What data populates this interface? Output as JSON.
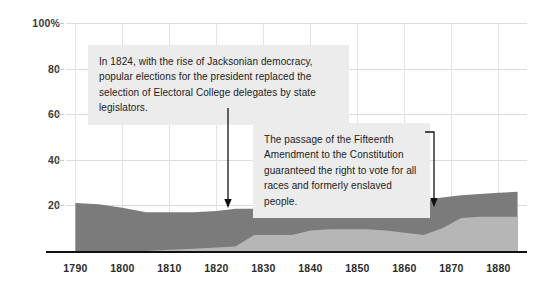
{
  "chart_data": {
    "type": "area",
    "title": "",
    "subtitle": "",
    "xlabel": "",
    "ylabel": "",
    "xlim": [
      1788,
      1886
    ],
    "ylim": [
      0,
      100
    ],
    "grid": true,
    "legend": "none",
    "stacked": true,
    "y_ticks": [
      "100%",
      "80",
      "60",
      "40",
      "20"
    ],
    "y_tick_values": [
      100,
      80,
      60,
      40,
      20
    ],
    "x_ticks": [
      "1790",
      "1800",
      "1810",
      "1820",
      "1830",
      "1840",
      "1850",
      "1860",
      "1870",
      "1880"
    ],
    "x_tick_values": [
      1790,
      1800,
      1810,
      1820,
      1830,
      1840,
      1850,
      1860,
      1870,
      1880
    ],
    "x": [
      1790,
      1795,
      1800,
      1805,
      1810,
      1815,
      1820,
      1824,
      1828,
      1832,
      1836,
      1840,
      1844,
      1848,
      1852,
      1856,
      1860,
      1864,
      1868,
      1872,
      1876,
      1880,
      1884
    ],
    "series": [
      {
        "name": "lower-band",
        "color": "#b6b6b6",
        "values": [
          0,
          0,
          0,
          0,
          0.5,
          1,
          1.5,
          2,
          7,
          7,
          7,
          9,
          9.5,
          9.5,
          9.5,
          9,
          8,
          7,
          10,
          14.5,
          15,
          15,
          15
        ]
      },
      {
        "name": "upper-band",
        "color": "#7b7b7b",
        "values": [
          21,
          20.5,
          19,
          17,
          16.5,
          16,
          16,
          16.5,
          11.5,
          12,
          12.5,
          11.5,
          11.5,
          12,
          12.5,
          14,
          15.5,
          15,
          13.5,
          10,
          10,
          10.5,
          11
        ]
      }
    ],
    "totals": [
      21,
      20.5,
      19,
      17,
      17,
      17,
      17.5,
      18.5,
      18.5,
      19,
      19.5,
      20.5,
      21,
      21.5,
      22,
      23,
      23.5,
      22,
      23.5,
      24.5,
      25,
      25.5,
      26
    ]
  },
  "colors": {
    "area_upper": "#7b7b7b",
    "area_lower": "#b6b6b6",
    "gridline": "#dcdcdc",
    "axis": "#111111",
    "annotation_background": "#ececec",
    "annotation_text": "#1b1b1b",
    "tick_text": "#2b2b2b"
  },
  "annotations": [
    {
      "id": "annotation-jacksonian-democracy",
      "text": "In 1824, with the rise of Jacksonian democracy, popular elections for the president replaced the selection of Electoral College delegates by state legislators.",
      "points_to_year": 1824,
      "arrow": "down"
    },
    {
      "id": "annotation-fifteenth-amendment",
      "text": "The passage of the Fifteenth Amendment to the Constitution guaranteed the right to vote for all races and formerly enslaved people.",
      "points_to_year": 1870,
      "arrow": "down-elbow"
    }
  ]
}
